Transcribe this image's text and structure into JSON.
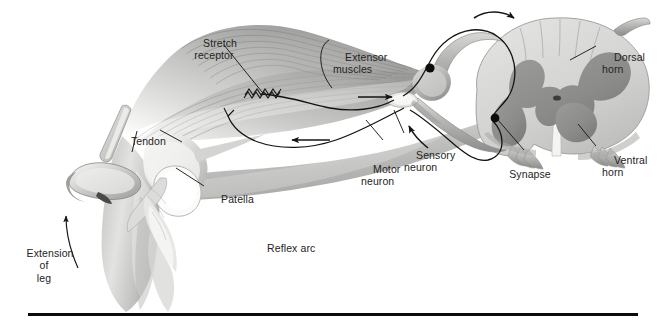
{
  "figure": {
    "title": "Reflex arc",
    "caption_label": "Reflex arc",
    "width": 667,
    "height": 328,
    "background": "#ffffff",
    "rule_color": "#0b0b0b"
  },
  "labels": {
    "stretch_receptor": "Stretch\nreceptor",
    "extensor_muscles": "Extensor\nmuscles",
    "dorsal_horn": "Dorsal\nhorn",
    "ventral_horn": "Ventral\nhorn",
    "synapse": "Synapse",
    "sensory_neuron": "Sensory\nneuron",
    "motor_neuron": "Motor\nneuron",
    "tendon": "Tendon",
    "patella": "Patella",
    "reflex_arc": "Reflex arc",
    "extension_of_leg": "Extension\nof\nleg"
  },
  "colors": {
    "text": "#242424",
    "leader_line": "#1a1a1a",
    "white_matter": "#d5d5d3",
    "gray_matter": "#8e8e8c",
    "gray_matter_dark": "#7b7b79",
    "nerve_fill": "#bdbdbb",
    "nerve_shadow": "#8f8f8d",
    "muscle_light": "#e2e2e0",
    "muscle_mid": "#b9b9b7",
    "muscle_dark": "#8d8d8b",
    "bone_light": "#ebebe9",
    "bone_mid": "#c6c6c4",
    "skin_mid": "#c9c9c7",
    "hammer": "#cfcfcd",
    "axon_line": "#141414",
    "cell_body": "#0d0d0d"
  },
  "anatomy": {
    "spinal_cord": {
      "name": "spinal cord cross section",
      "dorsal_side": "upper-right",
      "ventral_side": "lower-left",
      "horns": [
        "dorsal horn",
        "ventral horn"
      ],
      "central_canal": true
    },
    "leg": {
      "name": "knee joint with patella",
      "parts": [
        "patella",
        "patellar tendon",
        "femur",
        "tibia",
        "extensor muscles"
      ]
    },
    "instrument": {
      "name": "reflex hammer",
      "action": "strikes tendon"
    },
    "neurons": [
      {
        "name": "sensory neuron",
        "direction": "muscle to spinal cord",
        "cell_body": "dorsal root ganglion"
      },
      {
        "name": "motor neuron",
        "direction": "spinal cord to muscle",
        "cell_body": "ventral horn"
      }
    ],
    "arrows": [
      {
        "name": "afferent-arrow",
        "meaning": "signal toward spinal cord"
      },
      {
        "name": "efferent-arrow",
        "meaning": "signal toward muscle"
      },
      {
        "name": "dorsal-root-arrow",
        "meaning": "impulse entering dorsal root"
      },
      {
        "name": "ventral-root-arrow",
        "meaning": "impulse leaving ventral root"
      },
      {
        "name": "extension-arrow",
        "meaning": "leg kicks forward"
      }
    ]
  }
}
